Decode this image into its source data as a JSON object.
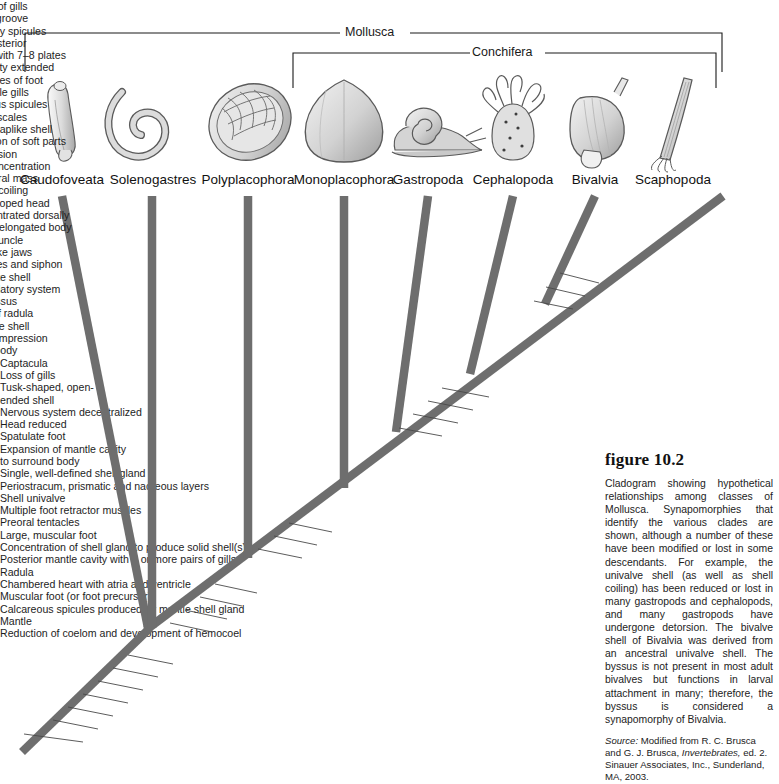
{
  "figure": {
    "number": "figure 10.2",
    "caption": "Cladogram showing hypothetical relationships among classes of Mollusca. Synapomorphies that identify the various clades are shown, although a number of these have been modified or lost in some descendants. For example, the univalve shell (as well as shell coiling) has been reduced or lost in many gastropods and cephalopods, and many gastropods have undergone detorsion. The bivalve shell of Bivalvia was derived from an ancestral univalve shell. The byssus is not present in most adult bivalves but functions in larval attachment in many; therefore, the byssus is considered a synapomorphy of Bivalvia.",
    "source_prefix": "Source:",
    "source_text_1": "Modified from R. C. Brusca and G. J. Brusca,",
    "source_italic": "Invertebrates,",
    "source_text_2": "ed. 2. Sinauer Associates, Inc., Sunderland, MA, 2003."
  },
  "brackets": [
    {
      "label": "Mollusca",
      "x_left": 25,
      "x_right": 722,
      "y": 33,
      "label_x": 373
    },
    {
      "label": "Conchifera",
      "x_left": 293,
      "x_right": 716,
      "y": 53,
      "label_x": 505
    }
  ],
  "taxa": [
    {
      "name": "Caudofoveata",
      "x": 62
    },
    {
      "name": "Solenogastres",
      "x": 153
    },
    {
      "name": "Polyplacophora",
      "x": 248
    },
    {
      "name": "Monoplacophora",
      "x": 344
    },
    {
      "name": "Gastropoda",
      "x": 428
    },
    {
      "name": "Cephalopoda",
      "x": 513
    },
    {
      "name": "Bivalvia",
      "x": 595
    },
    {
      "name": "Scaphopoda",
      "x": 673
    }
  ],
  "synapomorphy_blocks": [
    {
      "id": "solenogastres",
      "lines": [
        "Loss of gills",
        "Foot groove",
        "Copulatory spicules",
        "at posterior"
      ],
      "x": 142,
      "y": 278,
      "align": "center"
    },
    {
      "id": "polyplacophora",
      "lines": [
        "Unique shell with 7–8 plates",
        "Mantle cavity extended",
        "along sides of foot",
        "Multiple gills"
      ],
      "x": 235,
      "y": 380,
      "align": "center"
    },
    {
      "id": "caudofoveata",
      "lines": [
        "Calcareous spicules",
        "form scales"
      ],
      "x": 84,
      "y": 448,
      "align": "center"
    },
    {
      "id": "monoplacophora",
      "lines": [
        "Univalve, caplike shell",
        "Serial repetition of soft parts"
      ],
      "x": 338,
      "y": 270,
      "align": "center"
    },
    {
      "id": "gastropoda",
      "lines": [
        "Torsion",
        "Further concentration",
        "of visceral mass"
      ],
      "x": 404,
      "y": 202,
      "align": "center"
    },
    {
      "id": "conchifera-node",
      "lines": [
        "Shell coiling",
        "Well-developed head",
        "Viscera concentrated dorsally",
        "Dorsoventrally elongated body"
      ],
      "x": 417,
      "y": 315,
      "align": "center"
    },
    {
      "id": "cephalopoda",
      "lines": [
        "Siphuncle",
        "Beaklike jaws",
        "Arms/tentacles and siphon",
        "Septate shell",
        "Closed circulatory system"
      ],
      "x": 463,
      "y": 253,
      "align": "center"
    },
    {
      "id": "bivalvia",
      "lines": [
        "Byssus",
        "Loss of radula",
        "Bivalve shell",
        "Lateral compression",
        "of body"
      ],
      "x": 574,
      "y": 196,
      "align": "center"
    }
  ],
  "leader_labels": [
    {
      "lines": [
        "Captacula"
      ],
      "tx": 604,
      "ty": 278,
      "lx1": 560,
      "ly1": 273,
      "lx2": 599,
      "ly2": 283
    },
    {
      "lines": [
        "Loss of gills"
      ],
      "tx": 590,
      "ty": 291,
      "lx1": 546,
      "ly1": 287,
      "lx2": 585,
      "ly2": 296
    },
    {
      "lines": [
        "Tusk-shaped, open-",
        "ended shell"
      ],
      "tx": 578,
      "ty": 304,
      "lx1": 534,
      "ly1": 301,
      "lx2": 573,
      "ly2": 309
    },
    {
      "lines": [
        "Nervous system decentralized"
      ],
      "tx": 494,
      "ty": 392,
      "lx1": 442,
      "ly1": 388,
      "lx2": 489,
      "ly2": 397
    },
    {
      "lines": [
        "Head reduced"
      ],
      "tx": 478,
      "ty": 405,
      "lx1": 428,
      "ly1": 401,
      "lx2": 473,
      "ly2": 410
    },
    {
      "lines": [
        "Spatulate foot"
      ],
      "tx": 463,
      "ty": 418,
      "lx1": 413,
      "ly1": 414,
      "lx2": 458,
      "ly2": 423
    },
    {
      "lines": [
        "Expansion of mantle cavity",
        "to surround body"
      ],
      "tx": 447,
      "ty": 431,
      "lx1": 399,
      "ly1": 428,
      "lx2": 442,
      "ly2": 436
    },
    {
      "lines": [
        "Single, well-defined shell gland"
      ],
      "tx": 337,
      "ty": 527,
      "lx1": 289,
      "ly1": 523,
      "lx2": 332,
      "ly2": 532
    },
    {
      "lines": [
        "Periostracum, prismatic and nacreous layers"
      ],
      "tx": 322,
      "ty": 540,
      "lx1": 274,
      "ly1": 536,
      "lx2": 317,
      "ly2": 545
    },
    {
      "lines": [
        "Shell univalve"
      ],
      "tx": 307,
      "ty": 553,
      "lx1": 258,
      "ly1": 549,
      "lx2": 302,
      "ly2": 558
    },
    {
      "lines": [
        "Multiple foot retractor muscles"
      ],
      "tx": 262,
      "ty": 588,
      "lx1": 215,
      "ly1": 584,
      "lx2": 257,
      "ly2": 593
    },
    {
      "lines": [
        "Preoral tentacles"
      ],
      "tx": 247,
      "ty": 601,
      "lx1": 200,
      "ly1": 597,
      "lx2": 242,
      "ly2": 606
    },
    {
      "lines": [
        "Large, muscular foot"
      ],
      "tx": 232,
      "ty": 614,
      "lx1": 185,
      "ly1": 610,
      "lx2": 227,
      "ly2": 619
    },
    {
      "lines": [
        "Concentration of shell gland to produce solid shell(s)"
      ],
      "tx": 217,
      "ty": 627,
      "lx1": 170,
      "ly1": 623,
      "lx2": 212,
      "ly2": 632
    },
    {
      "lines": [
        "Posterior mantle cavity with 1 or more pairs of gills"
      ],
      "tx": 178,
      "ty": 659,
      "lx1": 128,
      "ly1": 655,
      "lx2": 173,
      "ly2": 664
    },
    {
      "lines": [
        "Radula"
      ],
      "tx": 163,
      "ty": 672,
      "lx1": 113,
      "ly1": 668,
      "lx2": 158,
      "ly2": 677
    },
    {
      "lines": [
        "Chambered heart with atria and ventricle"
      ],
      "tx": 148,
      "ty": 685,
      "lx1": 98,
      "ly1": 681,
      "lx2": 143,
      "ly2": 690
    },
    {
      "lines": [
        "Muscular foot (or foot precursor)"
      ],
      "tx": 133,
      "ty": 698,
      "lx1": 83,
      "ly1": 694,
      "lx2": 128,
      "ly2": 703
    },
    {
      "lines": [
        "Calcareous spicules produced by mantle shell gland"
      ],
      "tx": 118,
      "ty": 711,
      "lx1": 68,
      "ly1": 707,
      "lx2": 113,
      "ly2": 716
    },
    {
      "lines": [
        "Mantle"
      ],
      "tx": 103,
      "ty": 724,
      "lx1": 53,
      "ly1": 720,
      "lx2": 98,
      "ly2": 729
    },
    {
      "lines": [
        "Reduction of coelom and development of hemocoel"
      ],
      "tx": 88,
      "ty": 737,
      "lx1": 24,
      "ly1": 734,
      "lx2": 83,
      "ly2": 742
    }
  ],
  "colors": {
    "branch": "#6e6e6e",
    "bracket_line": "#1a1a1a",
    "text": "#1d1d1d",
    "caption_text": "#222222",
    "page_bg": "#ffffff",
    "organism_outline": "#555555",
    "organism_fill": "#d8d8d8"
  },
  "branches": {
    "root": {
      "x1": 22,
      "y1": 752,
      "x2": 148,
      "y2": 627
    },
    "spine": {
      "x1": 148,
      "y1": 627,
      "x2": 723,
      "y2": 196
    },
    "caudofoveata": {
      "x1": 148,
      "y1": 627,
      "x2": 62,
      "y2": 196
    },
    "solenogastres": {
      "x1": 152,
      "y1": 627,
      "x2": 152,
      "y2": 196
    },
    "polyplacophora": {
      "x1": 248,
      "y1": 560,
      "x2": 248,
      "y2": 196
    },
    "monoplacophora": {
      "x1": 344,
      "y1": 490,
      "x2": 344,
      "y2": 196
    },
    "gastropoda": {
      "x1": 399,
      "y1": 430,
      "x2": 428,
      "y2": 196
    },
    "cephalopoda": {
      "x1": 472,
      "y1": 368,
      "x2": 513,
      "y2": 196
    },
    "bivalvia": {
      "x1": 545,
      "y1": 300,
      "x2": 595,
      "y2": 196
    },
    "scaphopoda": {
      "x1": 545,
      "y1": 300,
      "x2": 723,
      "y2": 196
    }
  }
}
